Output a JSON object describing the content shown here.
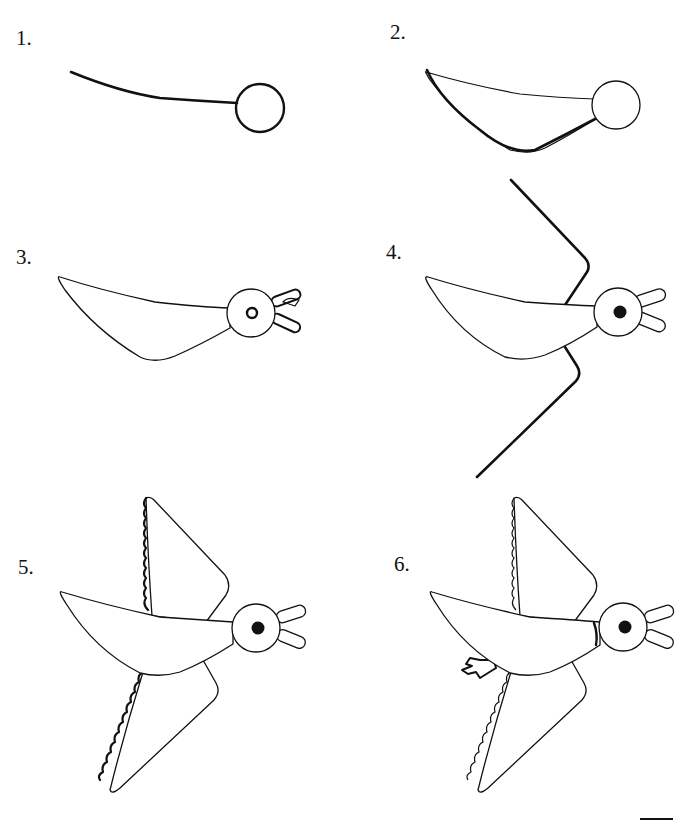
{
  "steps": [
    {
      "label": "1.",
      "description": "Draw a circle for the head and a curved line for the back"
    },
    {
      "label": "2.",
      "description": "Draw the body shape connecting to the head"
    },
    {
      "label": "3.",
      "description": "Add the eye and open beak"
    },
    {
      "label": "4.",
      "description": "Fill in the eye and draw the wing guide lines"
    },
    {
      "label": "5.",
      "description": "Draw the scalloped feather edges of the wings"
    },
    {
      "label": "6.",
      "description": "Add the neck band and the tail feet"
    }
  ],
  "colors": {
    "stroke": "#111111",
    "background": "#ffffff"
  }
}
